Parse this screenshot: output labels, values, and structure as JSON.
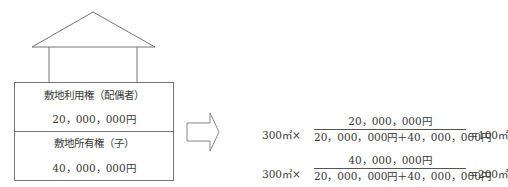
{
  "diagram": {
    "upper_section": {
      "label": "敷地利用権（配偶者）",
      "value": "20，000，000円"
    },
    "lower_section": {
      "label": "敷地所有権（子）",
      "value": "40，000，000円"
    },
    "arrow": "right-arrow"
  },
  "formulas": [
    {
      "area": "300㎡",
      "times": "×",
      "numerator": "20，000，000円",
      "denominator": "20，000，000円＋40，000，000円",
      "result": "＝100㎡"
    },
    {
      "area": "300㎡",
      "times": "×",
      "numerator": "40，000，000円",
      "denominator": "20，000，000円＋40，000，000円",
      "result": "＝200㎡"
    }
  ]
}
